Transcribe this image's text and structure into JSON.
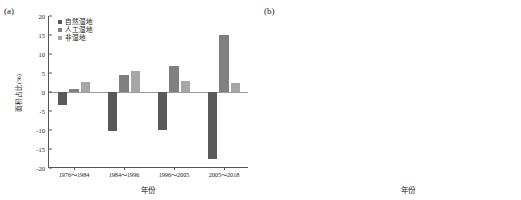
{
  "figure": {
    "panel_a_label": "(a)",
    "panel_b_label": "(b)"
  },
  "chart_data": [
    {
      "id": "panel-a",
      "type": "bar",
      "title": "(a)",
      "xlabel": "年份",
      "ylabel": "面积占比(%)",
      "categories": [
        "1976～1984",
        "1984～1996",
        "1996～2005",
        "2005～2018"
      ],
      "ylim": [
        -20,
        20
      ],
      "yticks": [
        20,
        15,
        10,
        5,
        0,
        -5,
        -10,
        -15,
        -20
      ],
      "grid": false,
      "legend_position": "top-left",
      "series": [
        {
          "name": "自然湿地",
          "color": "#595959",
          "values": [
            -3.4,
            -10.2,
            -9.9,
            -17.5
          ]
        },
        {
          "name": "人工湿地",
          "color": "#808080",
          "values": [
            0.8,
            4.6,
            6.8,
            15.1
          ]
        },
        {
          "name": "非湿地",
          "color": "#a6a6a6",
          "values": [
            2.6,
            5.5,
            2.8,
            2.4
          ]
        }
      ]
    },
    {
      "id": "panel-b",
      "type": "bar",
      "title": "(b)",
      "xlabel": "年份",
      "ylabel": "面积占比(%)",
      "categories": [
        "1976",
        "1981",
        "1984",
        "1991",
        "1996",
        "2001",
        "2005",
        "2010",
        "2014",
        "2018"
      ],
      "ylim": [
        0,
        80
      ],
      "yticks": [
        80,
        70,
        60,
        50,
        40,
        30,
        20,
        10,
        0
      ],
      "grid": false,
      "stacked": true,
      "legend_position": "top-right",
      "series": [
        {
          "name": "滩涂",
          "color": "#585858",
          "values": [
            25.3,
            26.1,
            26.6,
            20.5,
            23.2,
            22.9,
            19.1,
            17.6,
            16.2,
            12.8
          ]
        },
        {
          "name": "沼泽",
          "color": "#7d7d7d",
          "values": [
            5.8,
            5.2,
            6.4,
            5.4,
            4.9,
            4.7,
            4.5,
            3.6,
            3.2,
            3.4
          ]
        },
        {
          "name": "浅海湿地",
          "color": "#9b9b9b",
          "values": [
            0.6,
            0.5,
            0.5,
            0.5,
            0.5,
            0.5,
            0.4,
            0.4,
            0.4,
            0.4
          ]
        },
        {
          "name": "苇草地",
          "color": "#cfcfcf",
          "values": [
            35.2,
            32.7,
            27.4,
            25.4,
            24.9,
            21.5,
            21.0,
            14.0,
            12.1,
            12.0
          ]
        },
        {
          "name": "河流",
          "color": "#6f6f6f",
          "values": [
            5.6,
            5.2,
            7.6,
            6.6,
            4.4,
            2.9,
            3.0,
            2.0,
            1.8,
            2.0
          ]
        }
      ],
      "line_series": {
        "name": "自然湿地",
        "color": "#8a8a8a",
        "values": [
          72.5,
          69.7,
          68.5,
          58.4,
          57.9,
          52.5,
          48.0,
          37.6,
          33.7,
          30.6
        ]
      }
    }
  ]
}
